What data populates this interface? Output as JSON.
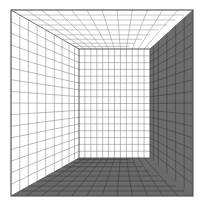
{
  "figure": {
    "type": "perspective-wireframe-diagram",
    "canvas": {
      "width": 205,
      "height": 211,
      "background": "#ffffff"
    }
  },
  "geometry": {
    "front_rect": {
      "left": 11,
      "top": 10,
      "right": 193,
      "bottom": 196
    },
    "back_rect": {
      "left": 79,
      "top": 49,
      "right": 150,
      "bottom": 158
    },
    "vanishing_point": {
      "x": 114.5,
      "y": 103.5
    },
    "divisions": {
      "back_wall_cols": 12,
      "back_wall_rows": 16,
      "depth_steps": 9,
      "side_wall_rows": 16,
      "floor_cols": 12,
      "ceiling_cols": 12
    }
  },
  "surfaces": [
    {
      "name": "back-wall",
      "fill": "#ffffff",
      "shaded": false
    },
    {
      "name": "left-wall",
      "fill": "#ffffff",
      "shaded": false
    },
    {
      "name": "ceiling",
      "fill": "#ffffff",
      "shaded": false
    },
    {
      "name": "right-wall",
      "fill": "#6d6d6d",
      "shaded": true
    },
    {
      "name": "floor",
      "fill": "#6a6a6a",
      "shaded": true
    }
  ],
  "colors": {
    "background": "#ffffff",
    "outline": "#4a4a4a",
    "grid_light": "#9a9a9a",
    "grid_faint": "#b9b9b9",
    "grid_dark": "#3a3a3a",
    "shade_mid": "#6d6d6d",
    "shade_floor": "#6a6a6a",
    "edge_highlight": "#e8e8e8"
  },
  "labels": {
    "caption": ""
  }
}
